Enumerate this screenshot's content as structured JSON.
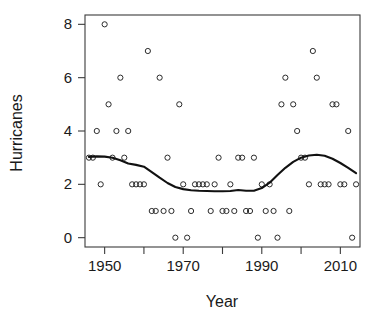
{
  "chart_data": {
    "type": "scatter",
    "title": "",
    "xlabel": "Year",
    "ylabel": "Hurricanes",
    "xlim": [
      1945,
      2015
    ],
    "ylim": [
      -0.35,
      8.35
    ],
    "grid": false,
    "legend": null,
    "x_ticks": [
      1950,
      1960,
      1970,
      1980,
      1990,
      2000,
      2010
    ],
    "x_tick_labels": [
      "1950",
      "",
      "1970",
      "",
      "1990",
      "",
      "2010"
    ],
    "y_ticks": [
      0,
      2,
      4,
      6,
      8
    ],
    "y_tick_labels": [
      "0",
      "2",
      "4",
      "6",
      "8"
    ],
    "marker": "open-circle",
    "point_color": "#2b2b2b",
    "line_color": "#111111",
    "x": [
      1946,
      1947,
      1948,
      1949,
      1950,
      1951,
      1952,
      1953,
      1954,
      1955,
      1956,
      1957,
      1958,
      1959,
      1960,
      1961,
      1962,
      1963,
      1964,
      1965,
      1966,
      1967,
      1968,
      1969,
      1970,
      1971,
      1972,
      1973,
      1974,
      1975,
      1976,
      1977,
      1978,
      1979,
      1980,
      1981,
      1982,
      1983,
      1984,
      1985,
      1986,
      1987,
      1988,
      1989,
      1990,
      1991,
      1992,
      1993,
      1994,
      1995,
      1996,
      1997,
      1998,
      1999,
      2000,
      2001,
      2002,
      2003,
      2004,
      2005,
      2006,
      2007,
      2008,
      2009,
      2010,
      2011,
      2012,
      2013,
      2014
    ],
    "y": [
      3,
      3,
      4,
      2,
      8,
      5,
      3,
      4,
      6,
      3,
      4,
      2,
      2,
      2,
      2,
      7,
      1,
      1,
      6,
      1,
      3,
      1,
      0,
      5,
      2,
      0,
      1,
      2,
      2,
      2,
      2,
      1,
      2,
      3,
      1,
      1,
      2,
      1,
      3,
      3,
      1,
      1,
      3,
      0,
      2,
      1,
      2,
      1,
      0,
      5,
      6,
      1,
      5,
      4,
      3,
      3,
      2,
      7,
      6,
      2,
      2,
      2,
      5,
      5,
      2,
      2,
      4,
      0,
      2
    ],
    "smoother": {
      "method": "loess",
      "points": [
        [
          1946.0,
          3.03
        ],
        [
          1948.0,
          3.05
        ],
        [
          1950.0,
          3.04
        ],
        [
          1952.0,
          3.0
        ],
        [
          1954.0,
          2.9
        ],
        [
          1956.0,
          2.78
        ],
        [
          1958.0,
          2.73
        ],
        [
          1960.0,
          2.66
        ],
        [
          1962.0,
          2.46
        ],
        [
          1964.0,
          2.25
        ],
        [
          1966.0,
          2.05
        ],
        [
          1968.0,
          1.9
        ],
        [
          1970.0,
          1.82
        ],
        [
          1972.0,
          1.78
        ],
        [
          1974.0,
          1.76
        ],
        [
          1976.0,
          1.75
        ],
        [
          1978.0,
          1.74
        ],
        [
          1980.0,
          1.74
        ],
        [
          1982.0,
          1.75
        ],
        [
          1984.0,
          1.79
        ],
        [
          1986.0,
          1.76
        ],
        [
          1988.0,
          1.76
        ],
        [
          1990.0,
          1.86
        ],
        [
          1992.0,
          2.06
        ],
        [
          1994.0,
          2.35
        ],
        [
          1996.0,
          2.62
        ],
        [
          1998.0,
          2.84
        ],
        [
          2000.0,
          3.0
        ],
        [
          2002.0,
          3.08
        ],
        [
          2004.0,
          3.11
        ],
        [
          2006.0,
          3.07
        ],
        [
          2008.0,
          2.96
        ],
        [
          2010.0,
          2.8
        ],
        [
          2012.0,
          2.62
        ],
        [
          2014.0,
          2.42
        ]
      ]
    }
  },
  "figure": {
    "background": "#ffffff",
    "axis_color": "#3b3b3b"
  }
}
